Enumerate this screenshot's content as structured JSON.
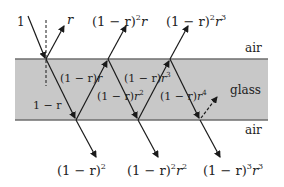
{
  "colors": {
    "glass_fill": "#c8c8c8",
    "surface_line": "#6e6e6e",
    "ray": "#1a1a1a",
    "text": "#222222",
    "background": "#ffffff"
  },
  "media": {
    "top": "air",
    "middle": "glass",
    "bottom": "air"
  },
  "incident": {
    "label": "1"
  },
  "reflected_up": [
    {
      "base": "r",
      "exp": ""
    },
    {
      "base": "(1 − r)",
      "exp": "2",
      "tail": "r",
      "tail_exp": ""
    },
    {
      "base": "(1 − r)",
      "exp": "2",
      "tail": "r",
      "tail_exp": "3"
    }
  ],
  "transmitted_down": [
    {
      "base": "(1 − r)",
      "exp": "2",
      "tail": "",
      "tail_exp": ""
    },
    {
      "base": "(1 − r)",
      "exp": "2",
      "tail": "r",
      "tail_exp": "2"
    },
    {
      "base": "(1 − r)",
      "exp": "3",
      "tail": "r",
      "tail_exp": "3"
    }
  ],
  "internal": [
    {
      "id": "first-down",
      "text": "1 − r"
    },
    {
      "id": "first-up",
      "base": "(1 − r)",
      "tail": "r",
      "tail_exp": ""
    },
    {
      "id": "second-down",
      "base": "(1 − r)",
      "tail": "r",
      "tail_exp": "2"
    },
    {
      "id": "second-up",
      "base": "(1 − r)",
      "tail": "r",
      "tail_exp": "3"
    },
    {
      "id": "third-down",
      "base": "(1 − r)",
      "tail": "r",
      "tail_exp": "4"
    }
  ]
}
